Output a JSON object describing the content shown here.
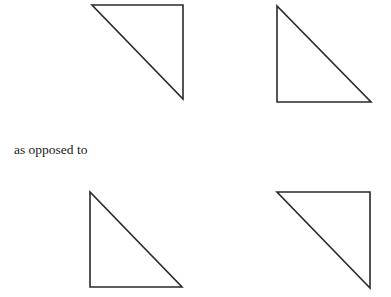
{
  "caption": {
    "text": "as opposed to"
  },
  "stroke_color": "#2a2a2a",
  "stroke_width": 1.6,
  "triangles": [
    {
      "id": "top-left",
      "points": "92,5 183,5 183,99"
    },
    {
      "id": "top-right",
      "points": "277,6 277,102 371,102"
    },
    {
      "id": "bottom-left",
      "points": "90,192 90,287 182,287"
    },
    {
      "id": "bottom-right",
      "points": "277,192 370,192 370,288"
    }
  ]
}
